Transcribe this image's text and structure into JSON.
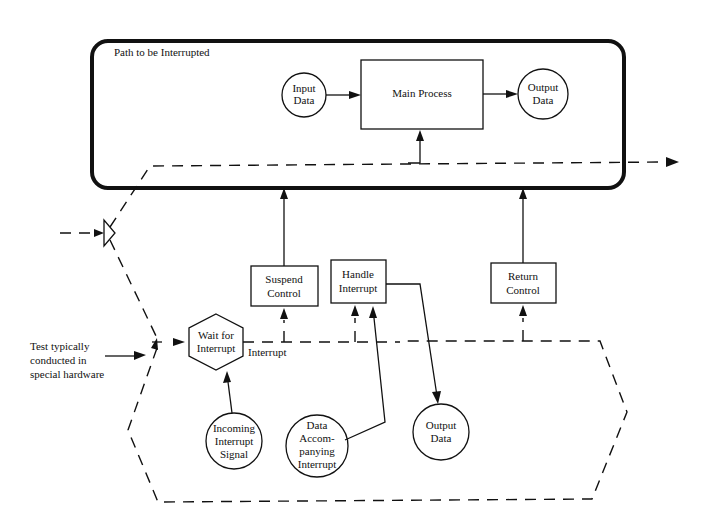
{
  "diagram": {
    "container": {
      "title": "Path to be Interrupted"
    },
    "nodes": {
      "input_data": {
        "line1": "Input",
        "line2": "Data"
      },
      "main_process": {
        "label": "Main Process"
      },
      "output_data_top": {
        "line1": "Output",
        "line2": "Data"
      },
      "suspend_control": {
        "line1": "Suspend",
        "line2": "Control"
      },
      "handle_interrupt": {
        "line1": "Handle",
        "line2": "Interrupt"
      },
      "return_control": {
        "line1": "Return",
        "line2": "Control"
      },
      "wait_for_interrupt": {
        "line1": "Wait for",
        "line2": "Interrupt"
      },
      "incoming_signal": {
        "line1": "Incoming",
        "line2": "Interrupt",
        "line3": "Signal"
      },
      "data_accompanying": {
        "line1": "Data",
        "line2": "Accom-",
        "line3": "panying",
        "line4": "Interrupt"
      },
      "output_data_bottom": {
        "line1": "Output",
        "line2": "Data"
      }
    },
    "annotations": {
      "interrupt_label": "Interrupt",
      "test_note": {
        "line1": "Test typically",
        "line2": "conducted in",
        "line3": "special hardware"
      }
    },
    "colors": {
      "ink": "#111111",
      "background": "#ffffff"
    }
  }
}
